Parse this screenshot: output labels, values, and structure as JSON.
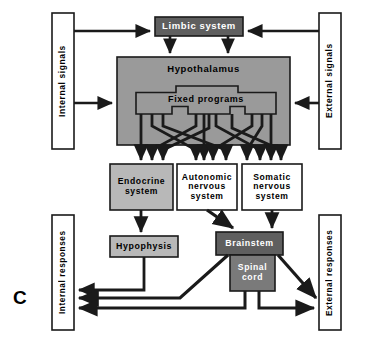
{
  "figure": {
    "panel_letter": "C",
    "background_color": "#ffffff",
    "line_color": "#1a1a1a"
  },
  "palette": {
    "dark_gray": "#5f5f5f",
    "mid_gray": "#9a9a9a",
    "light_gray": "#b8b8b8",
    "white": "#ffffff",
    "stroke": "#1a1a1a",
    "text_dark": "#000000",
    "text_light": "#ffffff"
  },
  "nodes": {
    "internal_signals": {
      "label": "Internal signals",
      "fill": "#ffffff",
      "text_color": "#000000",
      "orientation": "vertical",
      "x": 52,
      "y": 13,
      "w": 22,
      "h": 136
    },
    "external_signals": {
      "label": "External signals",
      "fill": "#ffffff",
      "text_color": "#000000",
      "orientation": "vertical",
      "x": 319,
      "y": 13,
      "w": 22,
      "h": 136
    },
    "limbic_system": {
      "label": "Limbic system",
      "fill": "#5f5f5f",
      "text_color": "#ffffff",
      "orientation": "horizontal",
      "x": 155,
      "y": 17,
      "w": 88,
      "h": 19
    },
    "hypothalamus": {
      "label": "Hypothalamus",
      "fill": "#9a9a9a",
      "text_color": "#000000",
      "orientation": "horizontal",
      "x": 117,
      "y": 57,
      "w": 173,
      "h": 88
    },
    "fixed_programs": {
      "label": "Fixed programs",
      "fill": "#9a9a9a",
      "text_color": "#000000",
      "orientation": "horizontal"
    },
    "endocrine_system": {
      "label": "Endocrine\nsystem",
      "fill": "#b8b8b8",
      "text_color": "#000000",
      "orientation": "horizontal",
      "x": 110,
      "y": 164,
      "w": 63,
      "h": 46
    },
    "autonomic_nervous_system": {
      "label": "Autonomic\nnervous\nsystem",
      "fill": "#ffffff",
      "text_color": "#000000",
      "orientation": "horizontal",
      "x": 177,
      "y": 164,
      "w": 60,
      "h": 46
    },
    "somatic_nervous_system": {
      "label": "Somatic\nnervous\nsystem",
      "fill": "#ffffff",
      "text_color": "#000000",
      "orientation": "horizontal",
      "x": 242,
      "y": 164,
      "w": 60,
      "h": 46
    },
    "hypophysis": {
      "label": "Hypophysis",
      "fill": "#b8b8b8",
      "text_color": "#000000",
      "orientation": "horizontal",
      "x": 110,
      "y": 236,
      "w": 68,
      "h": 21
    },
    "brainstem": {
      "label": "Brainstem",
      "fill": "#5f5f5f",
      "text_color": "#ffffff",
      "orientation": "horizontal",
      "x": 216,
      "y": 232,
      "w": 67,
      "h": 23
    },
    "spinal_cord": {
      "label": "Spinal\ncord",
      "fill": "#7a7a7a",
      "text_color": "#ffffff",
      "orientation": "horizontal",
      "x": 230,
      "y": 255,
      "w": 45,
      "h": 36
    },
    "internal_responses": {
      "label": "Internal responses",
      "fill": "#ffffff",
      "text_color": "#000000",
      "orientation": "vertical",
      "x": 52,
      "y": 215,
      "w": 22,
      "h": 115
    },
    "external_responses": {
      "label": "External responses",
      "fill": "#ffffff",
      "text_color": "#000000",
      "orientation": "vertical",
      "x": 319,
      "y": 215,
      "w": 22,
      "h": 115
    }
  },
  "connections": [
    {
      "name": "internal-signals-to-limbic",
      "from": "internal_signals",
      "to": "limbic_system"
    },
    {
      "name": "external-signals-to-limbic",
      "from": "external_signals",
      "to": "limbic_system"
    },
    {
      "name": "internal-signals-to-hypothalamus",
      "from": "internal_signals",
      "to": "hypothalamus"
    },
    {
      "name": "external-signals-to-hypothalamus",
      "from": "external_signals",
      "to": "hypothalamus"
    },
    {
      "name": "limbic-to-hypothalamus-left",
      "from": "limbic_system",
      "to": "hypothalamus"
    },
    {
      "name": "limbic-to-hypothalamus-right",
      "from": "limbic_system",
      "to": "hypothalamus"
    },
    {
      "name": "fixed-programs-to-endocrine",
      "from": "fixed_programs",
      "to": "endocrine_system"
    },
    {
      "name": "fixed-programs-to-autonomic",
      "from": "fixed_programs",
      "to": "autonomic_nervous_system"
    },
    {
      "name": "fixed-programs-to-somatic",
      "from": "fixed_programs",
      "to": "somatic_nervous_system"
    },
    {
      "name": "endocrine-to-hypophysis",
      "from": "endocrine_system",
      "to": "hypophysis"
    },
    {
      "name": "autonomic-to-brainstem",
      "from": "autonomic_nervous_system",
      "to": "brainstem"
    },
    {
      "name": "somatic-to-brainstem",
      "from": "somatic_nervous_system",
      "to": "brainstem"
    },
    {
      "name": "hypophysis-to-internal-responses",
      "from": "hypophysis",
      "to": "internal_responses"
    },
    {
      "name": "brainstem-to-internal-responses",
      "from": "brainstem",
      "to": "internal_responses"
    },
    {
      "name": "spinal-cord-to-internal-responses",
      "from": "spinal_cord",
      "to": "internal_responses"
    },
    {
      "name": "brainstem-to-external-responses",
      "from": "brainstem",
      "to": "external_responses"
    },
    {
      "name": "spinal-cord-to-external-responses",
      "from": "spinal_cord",
      "to": "external_responses"
    }
  ]
}
